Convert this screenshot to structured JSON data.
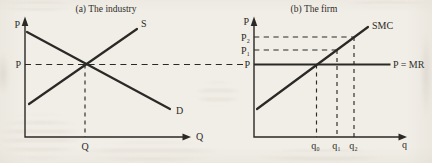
{
  "figure": {
    "colors": {
      "ink": "#2b2926",
      "paper": "#f1eee7"
    },
    "panel_industry": {
      "title": "(a) The industry",
      "y_axis_label": "P",
      "x_axis_label": "Q",
      "supply_curve_label": "S",
      "demand_curve_label": "D",
      "price_tick_label": "P",
      "quantity_tick_label": "Q"
    },
    "panel_firm": {
      "title": "(b) The firm",
      "y_axis_label": "P",
      "x_axis_label": "q",
      "smc_curve_label": "SMC",
      "price_line_label": "P = MR",
      "price_tick_labels": [
        "P₂",
        "P₁",
        "P"
      ],
      "quantity_tick_labels": [
        "q₀",
        "q₁",
        "q₂"
      ]
    }
  }
}
